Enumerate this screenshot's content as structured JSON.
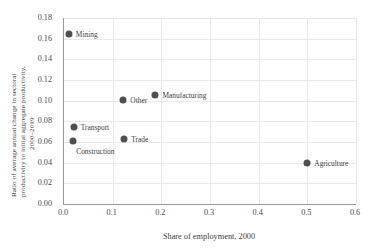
{
  "chart_data": {
    "type": "scatter",
    "title": "",
    "xlabel": "Share of employment, 2000",
    "ylabel": "Ratio of average annual change in sectoral productivity to initial aggregate productivity, 2000–2019",
    "ylabel_lines": [
      "Ratio of average annual change in sectoral",
      "productivity to initial aggregate productivity,",
      "2000–2019"
    ],
    "xlim": [
      0.0,
      0.6
    ],
    "ylim": [
      0.0,
      0.18
    ],
    "xticks": [
      "0.0",
      "0.1",
      "0.2",
      "0.3",
      "0.4",
      "0.5",
      "0.6"
    ],
    "xtick_values": [
      0.0,
      0.1,
      0.2,
      0.3,
      0.4,
      0.5,
      0.6
    ],
    "yticks": [
      "0.00",
      "0.02",
      "0.04",
      "0.06",
      "0.08",
      "0.10",
      "0.12",
      "0.14",
      "0.16",
      "0.18"
    ],
    "ytick_values": [
      0.0,
      0.02,
      0.04,
      0.06,
      0.08,
      0.1,
      0.12,
      0.14,
      0.16,
      0.18
    ],
    "grid": true,
    "legend": "none",
    "marker_color": "#4f4f4f",
    "points": [
      {
        "label": "Mining",
        "x": 0.012,
        "y": 0.1645,
        "label_side": "right"
      },
      {
        "label": "Manufacturing",
        "x": 0.19,
        "y": 0.1055,
        "label_side": "right"
      },
      {
        "label": "Other",
        "x": 0.124,
        "y": 0.1005,
        "label_side": "right"
      },
      {
        "label": "Transport",
        "x": 0.022,
        "y": 0.0745,
        "label_side": "right"
      },
      {
        "label": "Construction",
        "x": 0.021,
        "y": 0.0607,
        "label_side": "below"
      },
      {
        "label": "Trade",
        "x": 0.126,
        "y": 0.0632,
        "label_side": "right"
      },
      {
        "label": "Agriculture",
        "x": 0.502,
        "y": 0.0392,
        "label_side": "right"
      }
    ]
  }
}
